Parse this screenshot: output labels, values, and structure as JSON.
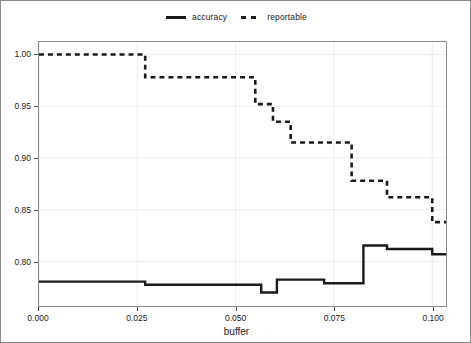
{
  "chart_data": {
    "type": "line",
    "subtype": "step",
    "title": "",
    "xlabel": "buffer",
    "ylabel": "",
    "xlim": [
      0.0,
      0.1035
    ],
    "ylim": [
      0.757,
      1.012
    ],
    "xticks": [
      0.0,
      0.025,
      0.05,
      0.075,
      0.1
    ],
    "xtick_labels": [
      "0.000",
      "0.025",
      "0.050",
      "0.075",
      "0.100"
    ],
    "yticks": [
      0.8,
      0.85,
      0.9,
      0.95,
      1.0
    ],
    "ytick_labels": [
      "0.80",
      "0.85",
      "0.90",
      "0.95",
      "1.00"
    ],
    "grid": true,
    "legend_position": "top-center",
    "series": [
      {
        "name": "accuracy",
        "style": "solid",
        "color": "#1a1a1a",
        "x": [
          0.0,
          0.027,
          0.0545,
          0.0565,
          0.0605,
          0.0725,
          0.0825,
          0.0885,
          0.1
        ],
        "y": [
          0.7805,
          0.7775,
          0.7775,
          0.77,
          0.7825,
          0.779,
          0.8155,
          0.812,
          0.807
        ]
      },
      {
        "name": "reportable",
        "style": "dashed",
        "color": "#1a1a1a",
        "x": [
          0.0,
          0.027,
          0.0525,
          0.055,
          0.0595,
          0.064,
          0.0705,
          0.0795,
          0.0845,
          0.0885,
          0.1
        ],
        "y": [
          1.0,
          0.978,
          0.978,
          0.952,
          0.935,
          0.915,
          0.915,
          0.878,
          0.878,
          0.862,
          0.838
        ]
      }
    ]
  },
  "legend": {
    "entries": [
      {
        "label": "accuracy",
        "marker": "solid-line-swatch"
      },
      {
        "label": "reportable",
        "marker": "dashed-line-swatch"
      }
    ]
  }
}
